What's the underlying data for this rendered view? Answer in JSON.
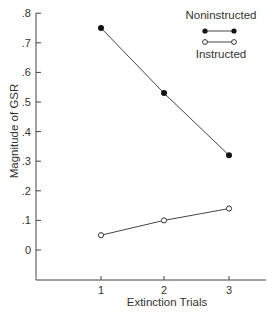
{
  "chart_data": {
    "type": "line",
    "title": "",
    "xlabel": "Extinction Trials",
    "ylabel": "Magnitude of GSR",
    "x": [
      1,
      2,
      3
    ],
    "categories": [
      "1",
      "2",
      "3"
    ],
    "series": [
      {
        "name": "Noninstructed",
        "marker": "filled-circle",
        "values": [
          0.75,
          0.53,
          0.32
        ]
      },
      {
        "name": "Instructed",
        "marker": "open-circle",
        "values": [
          0.05,
          0.1,
          0.14
        ]
      }
    ],
    "ylim": [
      -0.1,
      0.8
    ],
    "yticks": [
      0,
      0.1,
      0.2,
      0.3,
      0.4,
      0.5,
      0.6,
      0.7,
      0.8
    ],
    "ytick_labels": [
      "0",
      ".1",
      ".2",
      ".3",
      ".4",
      ".5",
      ".6",
      ".7",
      ".8"
    ],
    "xticks": [
      1,
      2,
      3
    ],
    "xtick_labels": [
      "1",
      "2",
      "3"
    ],
    "grid": false,
    "legend_position": "upper right",
    "colors": {
      "line": "#444444",
      "text": "#333333",
      "background": "#ffffff"
    }
  }
}
